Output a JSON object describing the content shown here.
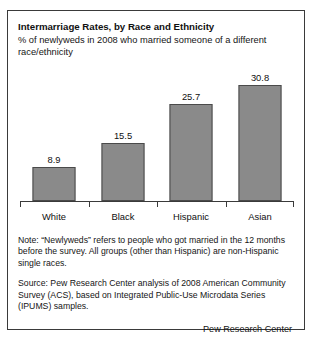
{
  "figure": {
    "title": "Intermarriage Rates, by Race and Ethnicity",
    "subtitle": "% of newlyweds in 2008 who married someone of a different race/ethnicity",
    "note": "Note: “Newlyweds” refers to people who got married in the 12 months before the survey. All groups (other than Hispanic) are non-Hispanic single races.",
    "source": "Source: Pew Research Center analysis of 2008 American Community Survey (ACS), based on Integrated Public-Use Microdata Series (IPUMS) samples.",
    "attribution": "Pew Research Center",
    "bar_color": "#8a8a8a",
    "bar_edge_color": "#4a4a4a",
    "axis_color": "#3a3a3a",
    "border_color": "#3a3a3a"
  },
  "chart_data": {
    "type": "bar",
    "title": "Intermarriage Rates, by Race and Ethnicity",
    "subtitle": "% of newlyweds in 2008 who married someone of a different race/ethnicity",
    "categories": [
      "White",
      "Black",
      "Hispanic",
      "Asian"
    ],
    "values": [
      8.9,
      15.5,
      25.7,
      30.8
    ],
    "value_labels": [
      "8.9",
      "15.5",
      "25.7",
      "30.8"
    ],
    "xlabel": "",
    "ylabel": "",
    "ylim": [
      0,
      35
    ],
    "grid": false,
    "legend": false,
    "y_axis_visible": false,
    "x_axis_visible": true
  }
}
